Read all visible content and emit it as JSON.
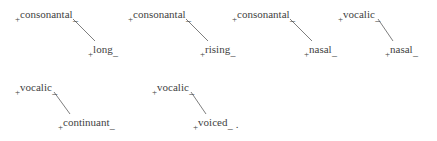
{
  "figure": {
    "type": "feature-tree-diagram",
    "background_color": "#ffffff",
    "text_color": "#3f3f3f",
    "line_color": "#6f6f6f",
    "trailing_punctuation": ".",
    "plus_sign": "+",
    "underscore": "_",
    "groups": [
      {
        "id": "group-1",
        "parent": {
          "plus": "+",
          "word": "consonantal",
          "tail": "_",
          "x": 15,
          "y": 9
        },
        "child": {
          "plus": "+",
          "word": "long",
          "tail": "_",
          "x": 88,
          "y": 44
        },
        "link": {
          "x1": 73,
          "y1": 19,
          "x2": 95,
          "y2": 41
        }
      },
      {
        "id": "group-2",
        "parent": {
          "plus": "+",
          "word": "consonantal",
          "tail": "_",
          "x": 128,
          "y": 9
        },
        "child": {
          "plus": "+",
          "word": "rising",
          "tail": "_",
          "x": 200,
          "y": 44
        },
        "link": {
          "x1": 186,
          "y1": 19,
          "x2": 208,
          "y2": 41
        }
      },
      {
        "id": "group-3",
        "parent": {
          "plus": "+",
          "word": "consonantal",
          "tail": "_",
          "x": 232,
          "y": 9
        },
        "child": {
          "plus": "+",
          "word": "nasal",
          "tail": "_",
          "x": 304,
          "y": 44
        },
        "link": {
          "x1": 290,
          "y1": 19,
          "x2": 312,
          "y2": 41
        }
      },
      {
        "id": "group-4",
        "parent": {
          "plus": "+",
          "word": "vocalic",
          "tail": "_",
          "x": 338,
          "y": 9
        },
        "child": {
          "plus": "+",
          "word": "nasal",
          "tail": "_",
          "x": 385,
          "y": 44
        },
        "link": {
          "x1": 378,
          "y1": 19,
          "x2": 393,
          "y2": 41
        }
      },
      {
        "id": "group-5",
        "parent": {
          "plus": "+",
          "word": "vocalic",
          "tail": "_",
          "x": 15,
          "y": 82
        },
        "child": {
          "plus": "+",
          "word": "continuant",
          "tail": "_",
          "x": 58,
          "y": 117
        },
        "link": {
          "x1": 54,
          "y1": 92,
          "x2": 70,
          "y2": 114
        }
      },
      {
        "id": "group-6",
        "parent": {
          "plus": "+",
          "word": "vocalic",
          "tail": "_",
          "x": 152,
          "y": 82
        },
        "child": {
          "plus": "+",
          "word": "voiced",
          "tail": "_",
          "period": ".",
          "x": 193,
          "y": 117
        },
        "link": {
          "x1": 191,
          "y1": 92,
          "x2": 206,
          "y2": 114
        }
      }
    ]
  }
}
